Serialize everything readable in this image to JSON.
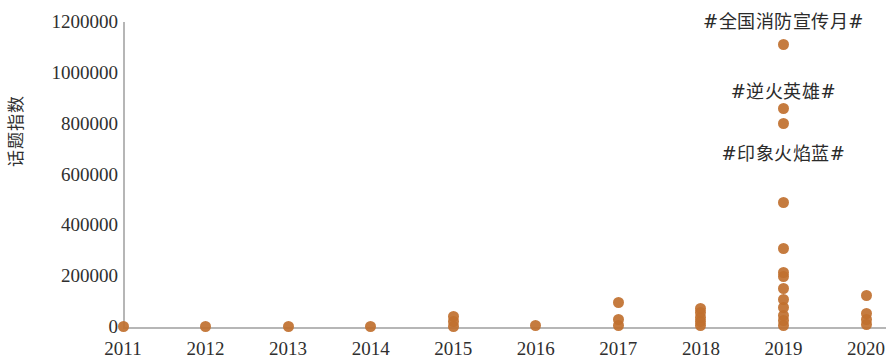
{
  "chart_data": {
    "type": "scatter",
    "title": "",
    "subtitle": "",
    "xlabel": "",
    "ylabel": "话题指数",
    "xlim": [
      2010.6,
      2020.4
    ],
    "ylim": [
      0,
      1200000
    ],
    "grid": false,
    "legend": null,
    "x_tick_labels": [
      "2011",
      "2012",
      "2013",
      "2014",
      "2015",
      "2016",
      "2017",
      "2018",
      "2019",
      "2020"
    ],
    "y_tick_labels": [
      "0",
      "200000",
      "400000",
      "600000",
      "800000",
      "1000000",
      "1200000"
    ],
    "y_ticks": [
      0,
      200000,
      400000,
      600000,
      800000,
      1000000,
      1200000
    ],
    "point_color": "#c0702f",
    "axis_color": "#b6b6b6",
    "series": [
      {
        "name": "话题指数",
        "points": [
          {
            "x": 2011,
            "y": 1000
          },
          {
            "x": 2012,
            "y": 1500
          },
          {
            "x": 2013,
            "y": 1200
          },
          {
            "x": 2014,
            "y": 2000
          },
          {
            "x": 2015,
            "y": 3000
          },
          {
            "x": 2015,
            "y": 22000
          },
          {
            "x": 2015,
            "y": 40000
          },
          {
            "x": 2016,
            "y": 4000
          },
          {
            "x": 2017,
            "y": 5000
          },
          {
            "x": 2017,
            "y": 30000
          },
          {
            "x": 2017,
            "y": 95000
          },
          {
            "x": 2018,
            "y": 4000
          },
          {
            "x": 2018,
            "y": 20000
          },
          {
            "x": 2018,
            "y": 38000
          },
          {
            "x": 2018,
            "y": 58000
          },
          {
            "x": 2018,
            "y": 72000
          },
          {
            "x": 2019,
            "y": 6000
          },
          {
            "x": 2019,
            "y": 25000
          },
          {
            "x": 2019,
            "y": 45000
          },
          {
            "x": 2019,
            "y": 75000
          },
          {
            "x": 2019,
            "y": 110000
          },
          {
            "x": 2019,
            "y": 150000
          },
          {
            "x": 2019,
            "y": 200000
          },
          {
            "x": 2019,
            "y": 215000
          },
          {
            "x": 2019,
            "y": 310000
          },
          {
            "x": 2019,
            "y": 490000
          },
          {
            "x": 2019,
            "y": 800000
          },
          {
            "x": 2019,
            "y": 860000
          },
          {
            "x": 2019,
            "y": 1110000
          },
          {
            "x": 2020,
            "y": 8000
          },
          {
            "x": 2020,
            "y": 30000
          },
          {
            "x": 2020,
            "y": 55000
          },
          {
            "x": 2020,
            "y": 125000
          }
        ]
      }
    ],
    "annotations": [
      {
        "text": "#全国消防宣传月#",
        "x": 2019,
        "y": 1200000,
        "anchor_point_y": 1110000
      },
      {
        "text": "#逆火英雄#",
        "x": 2019,
        "y": 925000,
        "anchor_point_y": 860000
      },
      {
        "text": "#印象火焰蓝#",
        "x": 2019,
        "y": 680000,
        "anchor_point_y": 800000
      }
    ]
  }
}
